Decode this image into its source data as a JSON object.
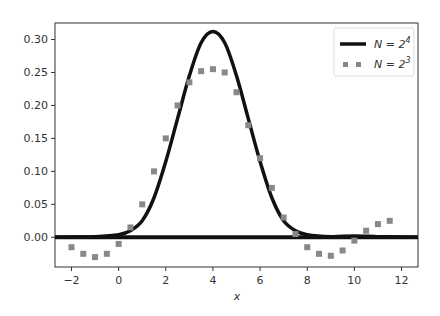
{
  "chart_data": {
    "type": "line",
    "title": "",
    "xlabel": "x",
    "ylabel": "",
    "xlim": [
      -2.7,
      12.7
    ],
    "ylim": [
      -0.045,
      0.325
    ],
    "grid": false,
    "legend_position": "upper right",
    "xticks": [
      -2,
      0,
      2,
      4,
      6,
      8,
      10,
      12
    ],
    "xtick_labels": [
      "−2",
      "0",
      "2",
      "4",
      "6",
      "8",
      "10",
      "12"
    ],
    "yticks": [
      0.0,
      0.05,
      0.1,
      0.15,
      0.2,
      0.25,
      0.3
    ],
    "ytick_labels": [
      "0.00",
      "0.05",
      "0.10",
      "0.15",
      "0.20",
      "0.25",
      "0.30"
    ],
    "series": [
      {
        "name": "N = 2^4",
        "style": "solid",
        "color": "#111111",
        "x": [
          -2.7,
          -2,
          -1,
          0,
          0.5,
          1,
          1.5,
          2,
          2.5,
          3,
          3.5,
          4,
          4.5,
          5,
          5.5,
          6,
          6.5,
          7,
          7.5,
          8,
          9,
          10,
          11,
          12,
          12.7
        ],
        "y": [
          0,
          0.0005,
          0.001,
          0.004,
          0.01,
          0.025,
          0.06,
          0.115,
          0.18,
          0.245,
          0.295,
          0.312,
          0.295,
          0.245,
          0.18,
          0.115,
          0.06,
          0.025,
          0.01,
          0.004,
          0.001,
          0.002,
          0.001,
          0.0005,
          0
        ]
      },
      {
        "name": "N = 2^3",
        "style": "dotted",
        "color": "#888888",
        "x": [
          -2,
          -1.5,
          -1,
          -0.5,
          0,
          0.5,
          1,
          1.5,
          2,
          2.5,
          3,
          3.5,
          4,
          4.5,
          5,
          5.5,
          6,
          6.5,
          7,
          7.5,
          8,
          8.5,
          9,
          9.5,
          10,
          10.5,
          11,
          11.5
        ],
        "y": [
          -0.015,
          -0.025,
          -0.03,
          -0.025,
          -0.01,
          0.015,
          0.05,
          0.1,
          0.15,
          0.2,
          0.235,
          0.252,
          0.255,
          0.25,
          0.22,
          0.17,
          0.12,
          0.075,
          0.03,
          0.005,
          -0.015,
          -0.025,
          -0.028,
          -0.02,
          -0.005,
          0.01,
          0.02,
          0.025
        ]
      }
    ],
    "horizontal_line": {
      "y": 0,
      "color": "#111111",
      "style": "solid"
    }
  }
}
